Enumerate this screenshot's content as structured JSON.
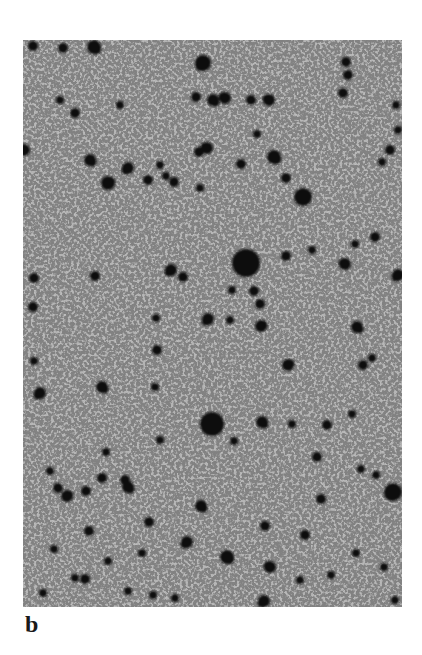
{
  "figure": {
    "panel_label": "b",
    "image": {
      "description": "Grayscale micrograph-like field of dark circular spots on a light gray, finely grained background",
      "background_color": "#b4b4b4",
      "spot_color": "#111111",
      "frame": {
        "x": 23,
        "y": 40,
        "width": 379,
        "height": 567
      }
    },
    "spots": [
      {
        "x": 246,
        "y": 263,
        "r": 14
      },
      {
        "x": 212,
        "y": 424,
        "r": 12
      },
      {
        "x": 203,
        "y": 63,
        "r": 8
      },
      {
        "x": 303,
        "y": 197,
        "r": 9
      },
      {
        "x": 393,
        "y": 492,
        "r": 9
      },
      {
        "x": 274,
        "y": 157,
        "r": 7
      },
      {
        "x": 269,
        "y": 100,
        "r": 6
      },
      {
        "x": 213,
        "y": 100,
        "r": 6
      },
      {
        "x": 196,
        "y": 97,
        "r": 5
      },
      {
        "x": 120,
        "y": 105,
        "r": 4
      },
      {
        "x": 75,
        "y": 113,
        "r": 5
      },
      {
        "x": 60,
        "y": 100,
        "r": 4
      },
      {
        "x": 24,
        "y": 150,
        "r": 6
      },
      {
        "x": 90,
        "y": 160,
        "r": 6
      },
      {
        "x": 128,
        "y": 168,
        "r": 6
      },
      {
        "x": 108,
        "y": 183,
        "r": 7
      },
      {
        "x": 148,
        "y": 180,
        "r": 5
      },
      {
        "x": 160,
        "y": 165,
        "r": 4
      },
      {
        "x": 207,
        "y": 148,
        "r": 6
      },
      {
        "x": 199,
        "y": 152,
        "r": 5
      },
      {
        "x": 200,
        "y": 188,
        "r": 4
      },
      {
        "x": 174,
        "y": 182,
        "r": 5
      },
      {
        "x": 166,
        "y": 176,
        "r": 4
      },
      {
        "x": 251,
        "y": 100,
        "r": 5
      },
      {
        "x": 225,
        "y": 98,
        "r": 6
      },
      {
        "x": 241,
        "y": 164,
        "r": 5
      },
      {
        "x": 286,
        "y": 178,
        "r": 5
      },
      {
        "x": 346,
        "y": 62,
        "r": 5
      },
      {
        "x": 348,
        "y": 75,
        "r": 5
      },
      {
        "x": 343,
        "y": 93,
        "r": 5
      },
      {
        "x": 398,
        "y": 130,
        "r": 4
      },
      {
        "x": 390,
        "y": 150,
        "r": 5
      },
      {
        "x": 382,
        "y": 162,
        "r": 4
      },
      {
        "x": 396,
        "y": 105,
        "r": 4
      },
      {
        "x": 257,
        "y": 134,
        "r": 4
      },
      {
        "x": 94,
        "y": 47,
        "r": 7
      },
      {
        "x": 63,
        "y": 48,
        "r": 5
      },
      {
        "x": 33,
        "y": 46,
        "r": 5
      },
      {
        "x": 254,
        "y": 291,
        "r": 5
      },
      {
        "x": 261,
        "y": 326,
        "r": 6
      },
      {
        "x": 260,
        "y": 304,
        "r": 5
      },
      {
        "x": 286,
        "y": 256,
        "r": 5
      },
      {
        "x": 345,
        "y": 264,
        "r": 6
      },
      {
        "x": 357,
        "y": 327,
        "r": 6
      },
      {
        "x": 363,
        "y": 365,
        "r": 5
      },
      {
        "x": 288,
        "y": 365,
        "r": 6
      },
      {
        "x": 372,
        "y": 358,
        "r": 4
      },
      {
        "x": 375,
        "y": 237,
        "r": 5
      },
      {
        "x": 355,
        "y": 244,
        "r": 4
      },
      {
        "x": 312,
        "y": 250,
        "r": 4
      },
      {
        "x": 232,
        "y": 290,
        "r": 4
      },
      {
        "x": 230,
        "y": 320,
        "r": 4
      },
      {
        "x": 398,
        "y": 275,
        "r": 6
      },
      {
        "x": 34,
        "y": 278,
        "r": 5
      },
      {
        "x": 95,
        "y": 276,
        "r": 5
      },
      {
        "x": 33,
        "y": 307,
        "r": 5
      },
      {
        "x": 171,
        "y": 270,
        "r": 6
      },
      {
        "x": 183,
        "y": 277,
        "r": 5
      },
      {
        "x": 208,
        "y": 319,
        "r": 6
      },
      {
        "x": 156,
        "y": 318,
        "r": 4
      },
      {
        "x": 157,
        "y": 350,
        "r": 5
      },
      {
        "x": 102,
        "y": 387,
        "r": 6
      },
      {
        "x": 40,
        "y": 393,
        "r": 6
      },
      {
        "x": 155,
        "y": 387,
        "r": 4
      },
      {
        "x": 34,
        "y": 361,
        "r": 4
      },
      {
        "x": 106,
        "y": 452,
        "r": 4
      },
      {
        "x": 160,
        "y": 440,
        "r": 4
      },
      {
        "x": 128,
        "y": 487,
        "r": 6
      },
      {
        "x": 58,
        "y": 488,
        "r": 5
      },
      {
        "x": 67,
        "y": 496,
        "r": 6
      },
      {
        "x": 102,
        "y": 478,
        "r": 5
      },
      {
        "x": 86,
        "y": 491,
        "r": 5
      },
      {
        "x": 125,
        "y": 480,
        "r": 5
      },
      {
        "x": 201,
        "y": 506,
        "r": 6
      },
      {
        "x": 187,
        "y": 542,
        "r": 6
      },
      {
        "x": 149,
        "y": 522,
        "r": 5
      },
      {
        "x": 85,
        "y": 579,
        "r": 5
      },
      {
        "x": 75,
        "y": 578,
        "r": 4
      },
      {
        "x": 153,
        "y": 595,
        "r": 4
      },
      {
        "x": 89,
        "y": 531,
        "r": 5
      },
      {
        "x": 50,
        "y": 471,
        "r": 4
      },
      {
        "x": 54,
        "y": 549,
        "r": 4
      },
      {
        "x": 128,
        "y": 591,
        "r": 4
      },
      {
        "x": 142,
        "y": 553,
        "r": 4
      },
      {
        "x": 270,
        "y": 567,
        "r": 6
      },
      {
        "x": 227,
        "y": 557,
        "r": 7
      },
      {
        "x": 265,
        "y": 526,
        "r": 5
      },
      {
        "x": 321,
        "y": 499,
        "r": 5
      },
      {
        "x": 317,
        "y": 457,
        "r": 5
      },
      {
        "x": 327,
        "y": 425,
        "r": 5
      },
      {
        "x": 292,
        "y": 424,
        "r": 4
      },
      {
        "x": 262,
        "y": 422,
        "r": 6
      },
      {
        "x": 361,
        "y": 469,
        "r": 4
      },
      {
        "x": 234,
        "y": 441,
        "r": 4
      },
      {
        "x": 264,
        "y": 601,
        "r": 6
      },
      {
        "x": 300,
        "y": 580,
        "r": 4
      },
      {
        "x": 352,
        "y": 414,
        "r": 4
      },
      {
        "x": 376,
        "y": 475,
        "r": 4
      },
      {
        "x": 305,
        "y": 535,
        "r": 5
      },
      {
        "x": 331,
        "y": 575,
        "r": 4
      },
      {
        "x": 356,
        "y": 553,
        "r": 4
      },
      {
        "x": 384,
        "y": 567,
        "r": 4
      },
      {
        "x": 395,
        "y": 600,
        "r": 4
      },
      {
        "x": 175,
        "y": 598,
        "r": 4
      },
      {
        "x": 108,
        "y": 561,
        "r": 4
      },
      {
        "x": 43,
        "y": 593,
        "r": 4
      }
    ]
  }
}
